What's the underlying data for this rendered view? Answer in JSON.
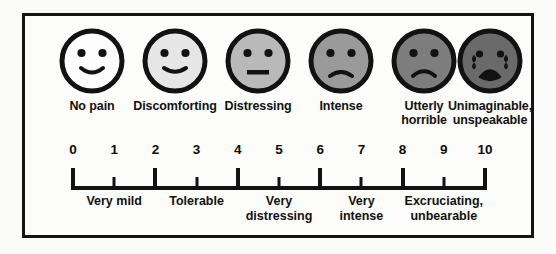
{
  "diagram": {
    "background_color": "#fcfcfb",
    "border_color": "#141414",
    "ink_color": "#121212"
  },
  "faces": [
    {
      "id": "face-no-pain",
      "label": "No pain",
      "expression": "smiling",
      "fill": "#fdfdfd",
      "has_tears": false,
      "center_x": 67
    },
    {
      "id": "face-discomforting",
      "label": "Discomforting",
      "expression": "slight-smile",
      "fill": "#e6e6e6",
      "has_tears": false,
      "center_x": 150
    },
    {
      "id": "face-distressing",
      "label": "Distressing",
      "expression": "neutral",
      "fill": "#b9b9b9",
      "has_tears": false,
      "center_x": 233
    },
    {
      "id": "face-intense",
      "label": "Intense",
      "expression": "frowning",
      "fill": "#9a9a9a",
      "has_tears": false,
      "center_x": 316
    },
    {
      "id": "face-utterly-horrible",
      "label": "Utterly\nhorrible",
      "expression": "deep-frown",
      "fill": "#7d7d7d",
      "has_tears": false,
      "center_x": 399
    },
    {
      "id": "face-unimaginable",
      "label": "Unimaginable,\nunspeakable",
      "expression": "crying",
      "fill": "#6a6a6a",
      "has_tears": true,
      "center_x": 465
    }
  ],
  "scale": {
    "numbers": [
      "0",
      "1",
      "2",
      "3",
      "4",
      "5",
      "6",
      "7",
      "8",
      "9",
      "10"
    ],
    "major_ticks": [
      0,
      2,
      4,
      6,
      8,
      10
    ],
    "descriptors": [
      {
        "id": "desc-very-mild",
        "text": "Very mild",
        "range": "0-2",
        "center_value": 1
      },
      {
        "id": "desc-tolerable",
        "text": "Tolerable",
        "range": "2-4",
        "center_value": 3
      },
      {
        "id": "desc-very-distressing",
        "text": "Very\ndistressing",
        "range": "4-6",
        "center_value": 5
      },
      {
        "id": "desc-very-intense",
        "text": "Very\nintense",
        "range": "6-8",
        "center_value": 7
      },
      {
        "id": "desc-excruciating",
        "text": "Excruciating,\nunbearable",
        "range": "8-10",
        "center_value": 9
      }
    ]
  },
  "chart_data": {
    "type": "bar",
    "xlabel": "Pain level",
    "ylabel": "",
    "categories": [
      "0",
      "1",
      "2",
      "3",
      "4",
      "5",
      "6",
      "7",
      "8",
      "9",
      "10"
    ],
    "values": [
      0,
      1,
      2,
      3,
      4,
      5,
      6,
      7,
      8,
      9,
      10
    ],
    "xlim": [
      0,
      10
    ],
    "grid": false,
    "legend": "none",
    "annotations": [
      {
        "label": "No pain",
        "at": 0
      },
      {
        "label": "Discomforting",
        "at": 2
      },
      {
        "label": "Distressing",
        "at": 4
      },
      {
        "label": "Intense",
        "at": 6
      },
      {
        "label": "Utterly horrible",
        "at": 8
      },
      {
        "label": "Unimaginable, unspeakable",
        "at": 10
      },
      {
        "label": "Very mild",
        "at": 1
      },
      {
        "label": "Tolerable",
        "at": 3
      },
      {
        "label": "Very distressing",
        "at": 5
      },
      {
        "label": "Very intense",
        "at": 7
      },
      {
        "label": "Excruciating, unbearable",
        "at": 9
      }
    ]
  }
}
